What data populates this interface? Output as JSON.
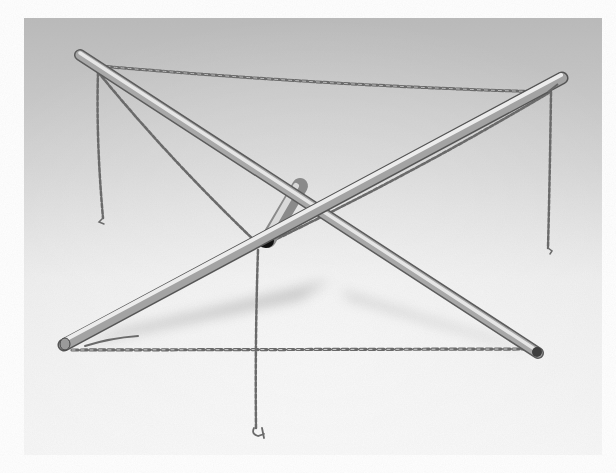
{
  "image": {
    "alt": "Grayscale photograph of a collapsible tubular metal stand: two long crossed rods with a short center tube, connected by chains at the ends, with chains hanging down",
    "subject": "crossed metal rod stand with chains",
    "palette": {
      "page_bg": "#ffffff",
      "backdrop_top": "#b9b9b9",
      "backdrop_mid": "#d6d6d6",
      "backdrop_bottom": "#f3f3f3",
      "rod_light": "#e4e4e4",
      "rod_mid": "#a9a9a9",
      "rod_dark": "#5a5a5a",
      "chain": "#6e6e6e",
      "tube_opening": "#111111"
    },
    "frame": {
      "x": 24,
      "y": 18,
      "width": 578,
      "height": 437
    }
  }
}
